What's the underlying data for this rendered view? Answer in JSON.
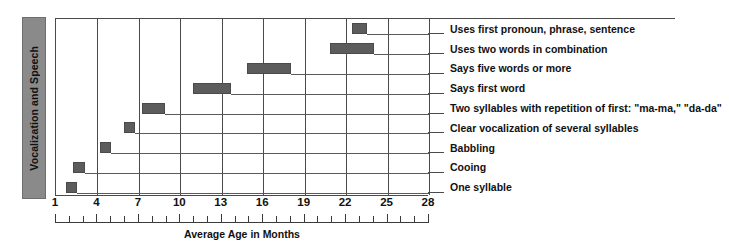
{
  "category_band": {
    "label": "Vocalization and Speech"
  },
  "axis": {
    "title": "Average Age in Months",
    "ticks": [
      1,
      4,
      7,
      10,
      13,
      16,
      19,
      22,
      25,
      28
    ],
    "minor_step": 1
  },
  "chart_data": {
    "type": "bar",
    "orientation": "horizontal-range",
    "title": "",
    "subtitle": "",
    "xlabel": "Average Age in Months",
    "ylabel": "Vocalization and Speech",
    "xlim": [
      1,
      28
    ],
    "grid": true,
    "legend": "none",
    "bar_color": "#5c5c5c",
    "categories": [
      "Uses first pronoun, phrase, sentence",
      "Uses two words in combination",
      "Says five words or more",
      "Says first word",
      "Two syllables with repetition of first: \"ma-ma,\" \"da-da\"",
      "Clear vocalization of several syllables",
      "Babbling",
      "Cooing",
      "One syllable"
    ],
    "ranges": [
      {
        "label": "Uses first pronoun, phrase, sentence",
        "start": 22.4,
        "end": 23.5
      },
      {
        "label": "Uses two words in combination",
        "start": 20.8,
        "end": 24.0
      },
      {
        "label": "Says five words or more",
        "start": 14.8,
        "end": 18.0
      },
      {
        "label": "Says first word",
        "start": 10.9,
        "end": 13.7
      },
      {
        "label": "Two syllables with repetition of first: \"ma-ma,\" \"da-da\"",
        "start": 7.2,
        "end": 8.9
      },
      {
        "label": "Clear vocalization of several syllables",
        "start": 5.9,
        "end": 6.7
      },
      {
        "label": "Babbling",
        "start": 4.2,
        "end": 5.0
      },
      {
        "label": "Cooing",
        "start": 2.2,
        "end": 3.1
      },
      {
        "label": "One syllable",
        "start": 1.7,
        "end": 2.5
      }
    ]
  }
}
